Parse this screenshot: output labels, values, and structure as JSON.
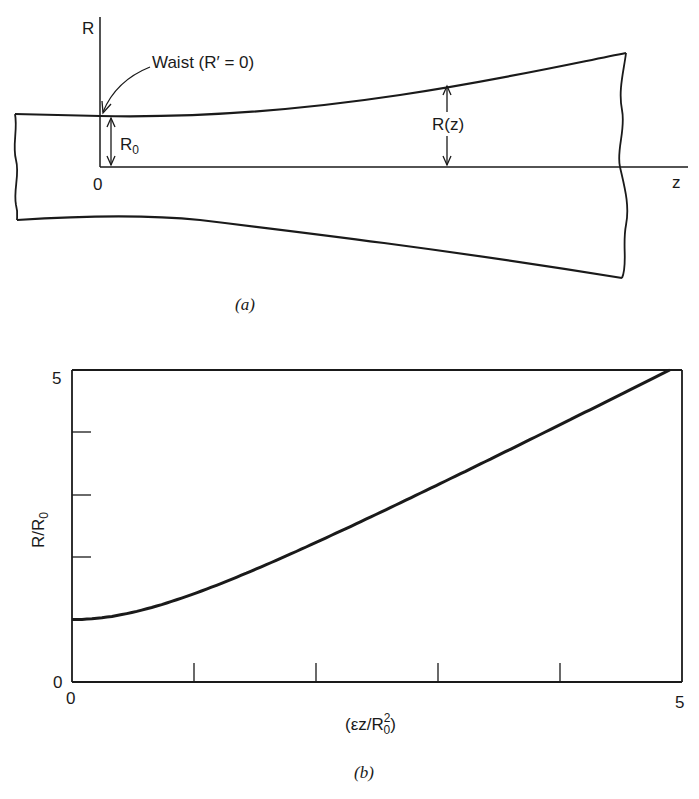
{
  "figure_a": {
    "caption": "(a)",
    "axis_r_label": "R",
    "axis_z_label": "z",
    "origin_label": "0",
    "waist_annotation": "Waist (R′ = 0)",
    "r0_label": "R",
    "r0_sub": "0",
    "rz_label": "R(z)"
  },
  "figure_b": {
    "caption": "(b)",
    "ylabel_main": "R/R",
    "ylabel_sub": "0",
    "xlabel_pre": "(εz/R",
    "xlabel_sup": "2",
    "xlabel_sub": "0",
    "xlabel_post": ")",
    "y_top_tick": "5",
    "y_bottom_tick": "0",
    "x_left_tick": "0",
    "x_right_tick": "5"
  },
  "chart_data": {
    "type": "line",
    "title": "",
    "xlabel": "(εz/R0^2)",
    "ylabel": "R/R0",
    "xlim": [
      0,
      5
    ],
    "ylim": [
      0,
      5
    ],
    "x_ticks": [
      0,
      1,
      2,
      3,
      4,
      5
    ],
    "y_ticks": [
      0,
      1,
      2,
      3,
      4,
      5
    ],
    "x_tick_labels": [
      "0",
      "",
      "",
      "",
      "",
      "5"
    ],
    "y_tick_labels": [
      "0",
      "",
      "",
      "",
      "",
      "5"
    ],
    "grid": false,
    "series": [
      {
        "name": "R/R0",
        "x": [
          0,
          0.5,
          1,
          1.5,
          2,
          2.5,
          3,
          3.5,
          4,
          4.5,
          4.9
        ],
        "values": [
          1.0,
          1.12,
          1.41,
          1.8,
          2.24,
          2.69,
          3.16,
          3.64,
          4.12,
          4.61,
          5.0
        ]
      }
    ]
  }
}
